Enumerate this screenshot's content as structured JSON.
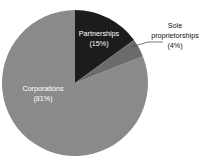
{
  "chart_data": {
    "type": "pie",
    "title": "",
    "subtitle": "",
    "xlabel": "",
    "ylabel": "",
    "legend_position": "none",
    "grid": false,
    "categories": [
      "Corporations",
      "Partnerships",
      "Sole proprietorships"
    ],
    "values": [
      81,
      15,
      4
    ],
    "unit": "percent",
    "start_angle_deg": 0,
    "direction": "clockwise",
    "slices": [
      {
        "name": "Partnerships",
        "value": 15,
        "value_label": "(15%)",
        "name_label": "Partnerships",
        "color": "#1c1c1c",
        "label_placement": "inside",
        "label_color": "#ffffff"
      },
      {
        "name": "Sole proprietorships",
        "value": 4,
        "value_label": "(4%)",
        "name_label_line1": "Sole",
        "name_label_line2": "proprietorships",
        "color": "#6b6b6b",
        "label_placement": "outside",
        "label_color": "#111111",
        "has_leader_line": true
      },
      {
        "name": "Corporations",
        "value": 81,
        "value_label": "(81%)",
        "name_label": "Corporations",
        "color": "#8a8a8a",
        "label_placement": "inside",
        "label_color": "#ffffff"
      }
    ]
  },
  "figure": {
    "background_color": "#ffffff",
    "center_x": 75,
    "center_y": 83,
    "radius": 73
  },
  "labels": {
    "partnerships_name": "Partnerships",
    "partnerships_pct": "(15%)",
    "corporations_name": "Corporations",
    "corporations_pct": "(81%)",
    "sole_line1": "Sole",
    "sole_line2": "proprietorships",
    "sole_pct": "(4%)"
  }
}
